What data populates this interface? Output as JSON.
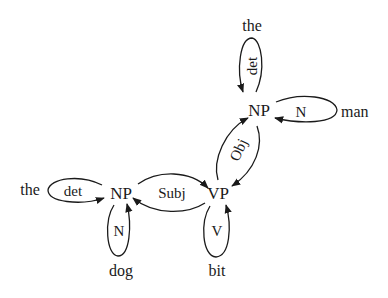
{
  "diagram": {
    "type": "dependency-graph",
    "nodes": {
      "np_obj": "NP",
      "np_subj": "NP",
      "vp": "VP"
    },
    "words": {
      "the_top": "the",
      "man": "man",
      "the_left": "the",
      "dog": "dog",
      "bit": "bit"
    },
    "edge_labels": {
      "det_top": "det",
      "n_man": "N",
      "obj": "Obj",
      "det_left": "det",
      "subj": "Subj",
      "n_dog": "N",
      "v_bit": "V"
    },
    "edges": [
      {
        "from": "the_top",
        "to": "np_obj",
        "label": "det"
      },
      {
        "from": "man",
        "to": "np_obj",
        "label": "N"
      },
      {
        "from": "vp",
        "to": "np_obj",
        "label": "Obj"
      },
      {
        "from": "np_obj",
        "to": "vp",
        "label": "Obj"
      },
      {
        "from": "the_left",
        "to": "np_subj",
        "label": "det"
      },
      {
        "from": "dog",
        "to": "np_subj",
        "label": "N"
      },
      {
        "from": "np_subj",
        "to": "vp",
        "label": "Subj"
      },
      {
        "from": "vp",
        "to": "np_subj",
        "label": "Subj"
      },
      {
        "from": "bit",
        "to": "vp",
        "label": "V"
      }
    ],
    "colors": {
      "ink": "#1a1a1a",
      "background": "#ffffff"
    }
  }
}
